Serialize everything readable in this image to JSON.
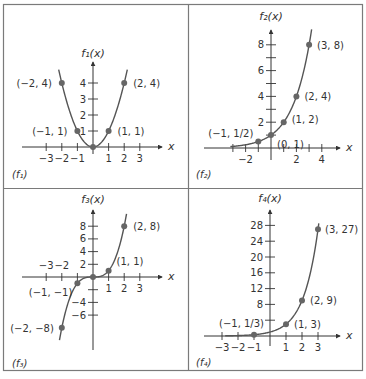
{
  "colors": {
    "border": "#7a7a7a",
    "axis": "#333333",
    "curve": "#555555",
    "point": "#666666",
    "text": "#333333"
  },
  "panels": [
    {
      "id": "f1",
      "label": "(f₁)",
      "ylabel": "f₁(x)",
      "xlabel": "x"
    },
    {
      "id": "f2",
      "label": "(f₂)",
      "ylabel": "f₂(x)",
      "xlabel": "x"
    },
    {
      "id": "f3",
      "label": "(f₃)",
      "ylabel": "f₃(x)",
      "xlabel": "x"
    },
    {
      "id": "f4",
      "label": "(f₄)",
      "ylabel": "f₄(x)",
      "xlabel": "x"
    }
  ],
  "chart_data": [
    {
      "type": "line",
      "title": "(f1)",
      "function": "x^2",
      "xlabel": "x",
      "ylabel": "f1(x)",
      "x_ticks": [
        -3,
        -2,
        -1,
        1,
        2,
        3
      ],
      "x_tick_labels": [
        "−3",
        "−2",
        "−1",
        "1",
        "2",
        "3"
      ],
      "y_ticks": [
        1,
        2,
        3,
        4
      ],
      "y_tick_labels": [
        "1",
        "2",
        "3",
        "4"
      ],
      "points": [
        {
          "x": -2,
          "y": 4,
          "label": "(−2, 4)"
        },
        {
          "x": -1,
          "y": 1,
          "label": "(−1, 1)"
        },
        {
          "x": 0,
          "y": 0,
          "label": ""
        },
        {
          "x": 1,
          "y": 1,
          "label": "(1, 1)"
        },
        {
          "x": 2,
          "y": 4,
          "label": "(2, 4)"
        }
      ],
      "xlim": [
        -3.5,
        4
      ],
      "ylim": [
        0,
        5.5
      ],
      "grid": false
    },
    {
      "type": "line",
      "title": "(f2)",
      "function": "2^x",
      "xlabel": "x",
      "ylabel": "f2(x)",
      "x_ticks": [
        -3,
        -2,
        -1,
        1,
        2,
        3,
        4
      ],
      "x_tick_labels": [
        "",
        "−2",
        "",
        "",
        "2",
        "",
        "4"
      ],
      "y_ticks": [
        1,
        2,
        3,
        4,
        5,
        6,
        7,
        8
      ],
      "y_tick_labels": [
        "",
        "2",
        "",
        "4",
        "",
        "6",
        "",
        "8"
      ],
      "points": [
        {
          "x": -1,
          "y": 0.5,
          "label": "(−1, 1/2)"
        },
        {
          "x": 0,
          "y": 1,
          "label": "(0, 1)"
        },
        {
          "x": 1,
          "y": 2,
          "label": "(1, 2)"
        },
        {
          "x": 2,
          "y": 4,
          "label": "(2, 4)"
        },
        {
          "x": 3,
          "y": 8,
          "label": "(3, 8)"
        }
      ],
      "xlim": [
        -3.5,
        5
      ],
      "ylim": [
        0,
        9
      ],
      "grid": false
    },
    {
      "type": "line",
      "title": "(f3)",
      "function": "x^3",
      "xlabel": "x",
      "ylabel": "f3(x)",
      "x_ticks": [
        -3,
        -2,
        -1,
        1,
        2,
        3
      ],
      "x_tick_labels": [
        "−3",
        "−2",
        "",
        "1",
        "2",
        "3"
      ],
      "y_ticks": [
        -6,
        -4,
        -2,
        2,
        4,
        6,
        8
      ],
      "y_tick_labels": [
        "−6",
        "−4",
        "",
        "2",
        "4",
        "6",
        "8"
      ],
      "points": [
        {
          "x": -2,
          "y": -8,
          "label": "(−2, −8)"
        },
        {
          "x": -1,
          "y": -1,
          "label": "(−1, −1)"
        },
        {
          "x": 0,
          "y": 0,
          "label": ""
        },
        {
          "x": 1,
          "y": 1,
          "label": "(1, 1)"
        },
        {
          "x": 2,
          "y": 8,
          "label": "(2, 8)"
        }
      ],
      "xlim": [
        -3.5,
        4
      ],
      "ylim": [
        -10,
        10
      ],
      "grid": false
    },
    {
      "type": "line",
      "title": "(f4)",
      "function": "3^x",
      "xlabel": "x",
      "ylabel": "f4(x)",
      "x_ticks": [
        -3,
        -2,
        -1,
        1,
        2,
        3
      ],
      "x_tick_labels": [
        "−3",
        "−2",
        "−1",
        "1",
        "2",
        "3"
      ],
      "y_ticks": [
        4,
        8,
        12,
        16,
        20,
        24,
        28
      ],
      "y_tick_labels": [
        "",
        "8",
        "12",
        "16",
        "20",
        "24",
        "28"
      ],
      "points": [
        {
          "x": -1,
          "y": 0.333,
          "label": "(−1, 1/3)"
        },
        {
          "x": 1,
          "y": 3,
          "label": "(1, 3)"
        },
        {
          "x": 2,
          "y": 9,
          "label": "(2, 9)"
        },
        {
          "x": 3,
          "y": 27,
          "label": "(3, 27)"
        }
      ],
      "xlim": [
        -3.5,
        4
      ],
      "ylim": [
        0,
        30
      ],
      "grid": false
    }
  ]
}
